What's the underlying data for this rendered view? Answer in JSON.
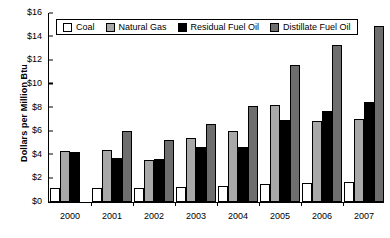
{
  "chart_data": {
    "type": "bar",
    "title": "",
    "xlabel": "",
    "ylabel": "Dollars per Million Btu",
    "categories": [
      "2000",
      "2001",
      "2002",
      "2003",
      "2004",
      "2005",
      "2006",
      "2007"
    ],
    "series": [
      {
        "name": "Coal",
        "color": "#ffffff",
        "values": [
          1.2,
          1.2,
          1.2,
          1.25,
          1.35,
          1.5,
          1.6,
          1.7
        ]
      },
      {
        "name": "Natural Gas",
        "color": "#a8a8a8",
        "values": [
          4.3,
          4.4,
          3.5,
          5.35,
          5.95,
          8.2,
          6.85,
          7.0
        ]
      },
      {
        "name": "Residual Fuel Oil",
        "color": "#000000",
        "values": [
          4.2,
          3.7,
          3.6,
          4.6,
          4.65,
          6.9,
          7.7,
          8.4
        ]
      },
      {
        "name": "Distillate Fuel Oil",
        "color": "#6e6e6e",
        "values": [
          null,
          6.0,
          5.25,
          6.6,
          8.1,
          11.5,
          13.2,
          14.85
        ]
      }
    ],
    "ylim": [
      0,
      16
    ],
    "ytick_values": [
      0,
      2,
      4,
      6,
      8,
      10,
      12,
      14,
      16
    ],
    "ytick_labels": [
      "$0",
      "$2",
      "$4",
      "$6",
      "$8",
      "$10",
      "$12",
      "$14",
      "$16"
    ],
    "grid": false,
    "legend_position": "top-left-inside"
  },
  "axis": {
    "y_title": "Dollars per Million Btu"
  },
  "legend": {
    "entries": [
      {
        "label": "Coal",
        "swatch": "coal-swatch"
      },
      {
        "label": "Natural Gas",
        "swatch": "natural-gas-swatch"
      },
      {
        "label": "Residual Fuel Oil",
        "swatch": "residual-fuel-oil-swatch"
      },
      {
        "label": "Distillate Fuel Oil",
        "swatch": "distillate-fuel-oil-swatch"
      }
    ]
  }
}
